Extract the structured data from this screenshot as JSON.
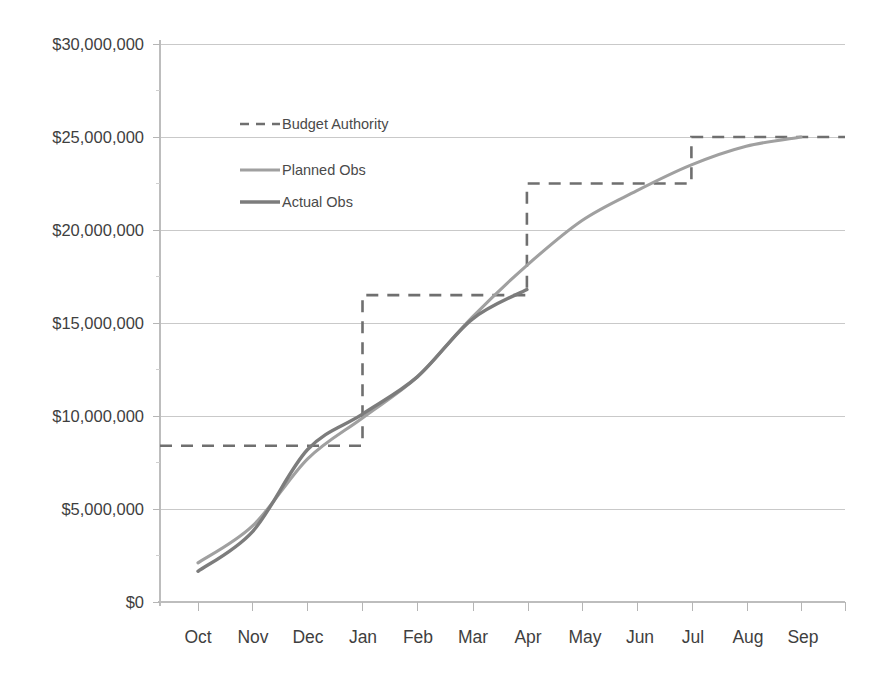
{
  "chart_data": {
    "type": "line",
    "title": "",
    "subtitle": "",
    "xlabel": "",
    "ylabel": "",
    "categories": [
      "Oct",
      "Nov",
      "Dec",
      "Jan",
      "Feb",
      "Mar",
      "Apr",
      "May",
      "Jun",
      "Jul",
      "Aug",
      "Sep"
    ],
    "ylim": [
      0,
      30000000
    ],
    "ytick_values": [
      0,
      5000000,
      10000000,
      15000000,
      20000000,
      25000000,
      30000000
    ],
    "ytick_labels": [
      "$0",
      "$5,000,000",
      "$10,000,000",
      "$15,000,000",
      "$20,000,000",
      "$25,000,000",
      "$30,000,000"
    ],
    "grid": true,
    "grid_axis": "y",
    "legend_position": "upper-left-inside",
    "series": [
      {
        "name": "Budget Authority",
        "style": "dashed-step",
        "color": "#6f6f6f",
        "values": [
          8400000,
          8400000,
          8400000,
          16500000,
          16500000,
          16500000,
          22500000,
          22500000,
          22500000,
          25000000,
          25000000,
          25000000
        ],
        "steps": [
          {
            "at": "Dec",
            "from": 8400000,
            "to": 16500000
          },
          {
            "at": "Mar",
            "from": 16500000,
            "to": 22500000
          },
          {
            "at": "Jun",
            "from": 22500000,
            "to": 25000000
          }
        ]
      },
      {
        "name": "Planned Obs",
        "style": "solid",
        "color": "#a0a0a0",
        "values": [
          2100000,
          4100000,
          7700000,
          9900000,
          12100000,
          15300000,
          18100000,
          20500000,
          22100000,
          23500000,
          24500000,
          25000000
        ]
      },
      {
        "name": "Actual Obs",
        "style": "solid",
        "color": "#7c7c7c",
        "values": [
          1650000,
          3800000,
          8200000,
          10100000,
          12100000,
          15200000,
          16800000,
          null,
          null,
          null,
          null,
          null
        ]
      }
    ]
  },
  "legend": {
    "items": [
      {
        "label": "Budget Authority",
        "swatch": "dashed"
      },
      {
        "label": "Planned Obs",
        "swatch": "solid-light"
      },
      {
        "label": "Actual Obs",
        "swatch": "solid-dark"
      }
    ]
  },
  "axes": {
    "y": {
      "labels": [
        "$30,000,000",
        "$25,000,000",
        "$20,000,000",
        "$15,000,000",
        "$10,000,000",
        "$5,000,000",
        "$0"
      ]
    },
    "x": {
      "labels": [
        "Oct",
        "Nov",
        "Dec",
        "Jan",
        "Feb",
        "Mar",
        "Apr",
        "May",
        "Jun",
        "Jul",
        "Aug",
        "Sep"
      ]
    }
  }
}
